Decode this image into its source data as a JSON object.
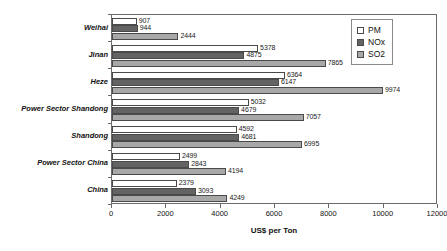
{
  "chart_data": {
    "type": "bar",
    "orientation": "horizontal",
    "title": "",
    "xlabel": "US$ per Ton",
    "ylabel": "",
    "xlim": [
      0,
      12000
    ],
    "xticks": [
      0,
      2000,
      4000,
      6000,
      8000,
      10000,
      12000
    ],
    "grid": false,
    "legend_position": "top-right",
    "categories": [
      "Weihai",
      "Jinan",
      "Heze",
      "Power Sector Shandong",
      "Shandong",
      "Power Sector China",
      "China"
    ],
    "series": [
      {
        "name": "PM",
        "color": "#ffffff",
        "values": [
          907,
          5378,
          6364,
          5032,
          4592,
          2499,
          2379
        ]
      },
      {
        "name": "NOx",
        "color": "#636363",
        "values": [
          944,
          4875,
          6147,
          4679,
          4681,
          2843,
          3093
        ]
      },
      {
        "name": "SO2",
        "color": "#a8a8a8",
        "values": [
          2444,
          7865,
          9974,
          7057,
          6995,
          4194,
          4249
        ]
      }
    ]
  },
  "legend": {
    "items": [
      {
        "label": "PM"
      },
      {
        "label": "NOx"
      },
      {
        "label": "SO2"
      }
    ]
  },
  "axis": {
    "x_title": "US$ per Ton",
    "x_tick_labels": [
      "0",
      "2000",
      "4000",
      "6000",
      "8000",
      "10000",
      "12000"
    ]
  },
  "colors": {
    "pm": "#ffffff",
    "nox": "#636363",
    "so2": "#a8a8a8",
    "frame": "#6b6b6b",
    "text": "#111111"
  }
}
